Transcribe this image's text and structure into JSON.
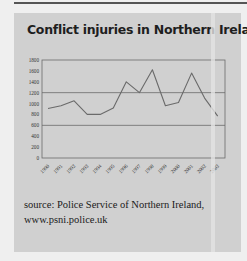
{
  "title": "Conflict injuries in Northern Ireland",
  "source_line1": "source: Police Service of Northern Ireland,",
  "source_line2": "www.psni.police.uk",
  "colors": {
    "card": "#d0d0d0",
    "background": "#efefef",
    "line": "#6a6a6a",
    "gridline": "#6a6a6a",
    "text": "#1e1e1e"
  },
  "chart_data": {
    "type": "line",
    "title": "Conflict injuries in Northern Ireland",
    "xlabel": "",
    "ylabel": "",
    "categories": [
      "1990",
      "1991",
      "1992",
      "1993",
      "1994",
      "1995",
      "1996",
      "1997",
      "1998",
      "1999",
      "2000",
      "2001",
      "2002",
      "2003"
    ],
    "series": [
      {
        "name": "Injuries",
        "values": [
          910,
          960,
          1050,
          800,
          800,
          920,
          1400,
          1200,
          1620,
          960,
          1020,
          1560,
          1100,
          770
        ]
      }
    ],
    "ylim": [
      0,
      1800
    ],
    "yticks": [
      0,
      200,
      400,
      600,
      800,
      1000,
      1200,
      1400,
      1600,
      1800
    ],
    "gridlines": [
      600,
      1200
    ],
    "legend": "none",
    "source": "source: Police Service of Northern Ireland, www.psni.police.uk"
  }
}
